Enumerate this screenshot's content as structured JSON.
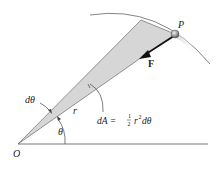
{
  "diagram": {
    "labels": {
      "point_P": "P",
      "force": "F",
      "origin": "O",
      "dtheta": "dθ",
      "theta": "θ",
      "radius": "r",
      "area_lhs": "dA =",
      "frac_num": "1",
      "frac_den": "2",
      "area_r": "r",
      "area_exp": "2",
      "area_dtheta": "dθ"
    },
    "colors": {
      "wedge_fill": "#d6d6d6",
      "line": "#333333",
      "particle": "#9a9a9a"
    }
  }
}
